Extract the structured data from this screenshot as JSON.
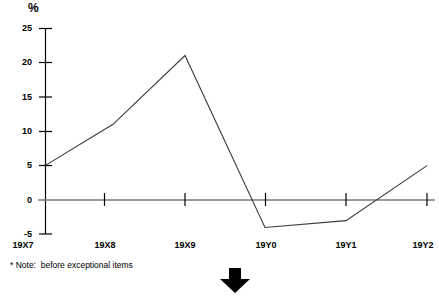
{
  "chart_data": {
    "type": "line",
    "title": "",
    "subtitle": "",
    "xlabel": "",
    "ylabel": "%",
    "categories": [
      "19X7",
      "19X8",
      "19X9",
      "19Y0",
      "19Y1",
      "19Y2"
    ],
    "values": [
      5,
      11,
      21,
      -4,
      -3,
      5
    ],
    "series": [
      {
        "name": "",
        "values": [
          5,
          11,
          21,
          -4,
          -3,
          5
        ]
      }
    ],
    "ylim": [
      -5,
      25
    ],
    "yticks": [
      25,
      20,
      15,
      10,
      5,
      0,
      -5
    ],
    "ytick_labels": [
      "25",
      "20",
      "15",
      "10",
      "5",
      "0",
      "-5"
    ],
    "xticks": [
      "19X7",
      "19X8",
      "19X9",
      "19Y0",
      "19Y1",
      "19Y2"
    ],
    "grid": false,
    "legend": false,
    "legend_position": "none",
    "line_color": "#3a3a3a",
    "axis_color": "#000000",
    "zero_line_color": "#7a7a7a",
    "background_color": "#ffffff",
    "annotations": [
      {
        "name": "footnote",
        "text": "* Note:  before exceptional items"
      }
    ]
  },
  "axis": {
    "unit_label": "%",
    "y_labels": [
      "25",
      "20",
      "15",
      "10",
      "5",
      "0",
      "-5"
    ],
    "x_labels": [
      "19X7",
      "19X8",
      "19X9",
      "19Y0",
      "19Y1",
      "19Y2"
    ]
  },
  "footer": {
    "note": "* Note:  before exceptional items",
    "arrow_icon": "down-arrow-icon"
  }
}
